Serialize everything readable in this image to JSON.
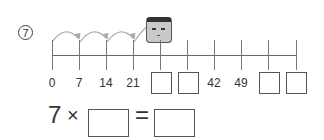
{
  "question_number": "7",
  "number_line": {
    "labels": [
      "0",
      "7",
      "14",
      "21",
      "",
      "",
      "42",
      "49",
      "",
      ""
    ],
    "blank_positions": [
      4,
      5,
      8,
      9
    ],
    "step": 7
  },
  "equation": {
    "left": "7",
    "operator": "×",
    "equals": "=",
    "blank1": "",
    "blank2": ""
  }
}
